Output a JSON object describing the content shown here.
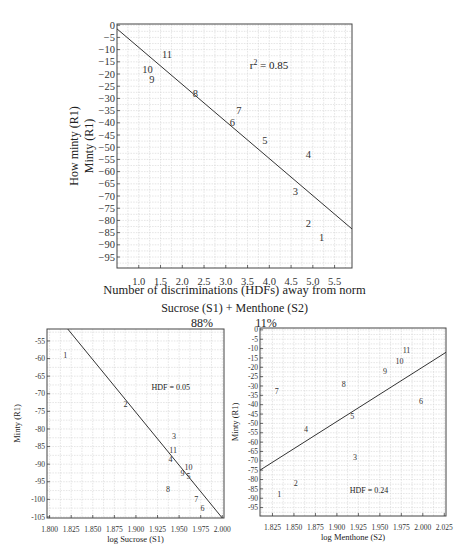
{
  "chart_data": [
    {
      "id": "main",
      "type": "scatter",
      "title": "",
      "xlabel": "Number of discriminations (HDFs) away from norm",
      "ylabel_lines": [
        "How minty (R1)",
        "Minty (R1)"
      ],
      "annotation": "r² = 0.85",
      "annotation_pos": [
        3.55,
        -18
      ],
      "xlim": [
        0.5,
        5.9
      ],
      "ylim": [
        -99.5,
        0.5
      ],
      "xticks": [
        1.0,
        1.5,
        2.0,
        2.5,
        3.0,
        3.5,
        4.0,
        4.5,
        5.0,
        5.5
      ],
      "xtick_labels": [
        "1.0",
        "1.5",
        "2.0",
        "2.5",
        "3.0",
        "3.5",
        "4.0",
        "4.5",
        "5.0",
        "5.5"
      ],
      "yticks": [
        0,
        -5,
        -10,
        -15,
        -20,
        -25,
        -30,
        -35,
        -40,
        -45,
        -50,
        -55,
        -60,
        -65,
        -70,
        -75,
        -80,
        -85,
        -90,
        -95
      ],
      "ytick_labels": [
        "0",
        "−5",
        "−10",
        "−15",
        "−20",
        "−25",
        "−30",
        "−35",
        "−40",
        "−45",
        "−50",
        "−55",
        "−60",
        "−65",
        "−70",
        "−75",
        "−80",
        "−85",
        "−90",
        "−95"
      ],
      "grid": true,
      "points": [
        {
          "label": "1",
          "x": 5.2,
          "y": -87
        },
        {
          "label": "2",
          "x": 4.9,
          "y": -81
        },
        {
          "label": "3",
          "x": 4.6,
          "y": -68
        },
        {
          "label": "4",
          "x": 4.9,
          "y": -53
        },
        {
          "label": "5",
          "x": 3.9,
          "y": -47
        },
        {
          "label": "6",
          "x": 3.15,
          "y": -40
        },
        {
          "label": "7",
          "x": 3.3,
          "y": -35
        },
        {
          "label": "8",
          "x": 2.3,
          "y": -28
        },
        {
          "label": "9",
          "x": 1.3,
          "y": -22
        },
        {
          "label": "10",
          "x": 1.2,
          "y": -18
        },
        {
          "label": "11",
          "x": 1.65,
          "y": -12
        }
      ],
      "fit_line": {
        "x": [
          0.5,
          5.9
        ],
        "y": [
          -1.5,
          -83.5
        ]
      },
      "r_squared": 0.85
    },
    {
      "id": "sucrose",
      "type": "scatter",
      "title": "",
      "xlabel": "log Sucrose (S1)",
      "ylabel": "Minty (R1)",
      "annotation": "HDF = 0.05",
      "annotation_pos": [
        1.918,
        -69
      ],
      "xlim": [
        1.797,
        2.002
      ],
      "ylim": [
        -105.3,
        -51.6
      ],
      "xticks": [
        1.8,
        1.825,
        1.85,
        1.875,
        1.9,
        1.925,
        1.95,
        1.975,
        2.0
      ],
      "xtick_labels": [
        "1.800",
        "1.825",
        "1.850",
        "1.875",
        "1.900",
        "1.925",
        "1.950",
        "1.975",
        "2.000"
      ],
      "yticks": [
        -55,
        -60,
        -65,
        -70,
        -75,
        -80,
        -85,
        -90,
        -95,
        -100,
        -105
      ],
      "ytick_labels": [
        "-55",
        "-60",
        "-65",
        "-70",
        "-75",
        "-80",
        "-85",
        "-90",
        "-95",
        "-100",
        "-105"
      ],
      "grid": true,
      "points": [
        {
          "label": "1",
          "x": 1.818,
          "y": -59
        },
        {
          "label": "2",
          "x": 1.888,
          "y": -73
        },
        {
          "label": "3",
          "x": 1.944,
          "y": -82
        },
        {
          "label": "4",
          "x": 1.94,
          "y": -88.5
        },
        {
          "label": "5",
          "x": 1.961,
          "y": -93.5
        },
        {
          "label": "6",
          "x": 1.977,
          "y": -102.5
        },
        {
          "label": "7",
          "x": 1.97,
          "y": -100
        },
        {
          "label": "8",
          "x": 1.937,
          "y": -97
        },
        {
          "label": "9",
          "x": 1.954,
          "y": -92.5
        },
        {
          "label": "10",
          "x": 1.961,
          "y": -91
        },
        {
          "label": "11",
          "x": 1.943,
          "y": -86
        }
      ],
      "fit_line": {
        "x": [
          1.821,
          2.0
        ],
        "y": [
          -51.6,
          -105.3
        ]
      },
      "hdf": 0.05
    },
    {
      "id": "menthone",
      "type": "scatter",
      "title": "",
      "xlabel": "log Menthone (S2)",
      "ylabel": "Minty (R1)",
      "annotation": "HDF = 0.24",
      "annotation_pos": [
        1.915,
        -87
      ],
      "xlim": [
        1.8105,
        2.027
      ],
      "ylim": [
        -99.5,
        1
      ],
      "xticks": [
        1.825,
        1.85,
        1.875,
        1.9,
        1.925,
        1.95,
        1.975,
        2.0,
        2.025
      ],
      "xtick_labels": [
        "1.825",
        "1.850",
        "1.875",
        "1.900",
        "1.925",
        "1.950",
        "1.975",
        "2.000",
        "2.025"
      ],
      "yticks": [
        0,
        -5,
        -10,
        -15,
        -20,
        -25,
        -30,
        -35,
        -40,
        -45,
        -50,
        -55,
        -60,
        -65,
        -70,
        -75,
        -80,
        -85,
        -90,
        -95
      ],
      "ytick_labels": [
        "0",
        "-5",
        "-10",
        "-15",
        "-20",
        "-25",
        "-30",
        "-35",
        "-40",
        "-45",
        "-50",
        "-55",
        "-60",
        "-65",
        "-70",
        "-75",
        "-80",
        "-85",
        "-90",
        "-95"
      ],
      "grid": true,
      "points": [
        {
          "label": "1",
          "x": 1.833,
          "y": -88
        },
        {
          "label": "2",
          "x": 1.852,
          "y": -82
        },
        {
          "label": "3",
          "x": 1.921,
          "y": -68
        },
        {
          "label": "4",
          "x": 1.864,
          "y": -53
        },
        {
          "label": "5",
          "x": 1.918,
          "y": -46
        },
        {
          "label": "6",
          "x": 1.998,
          "y": -38
        },
        {
          "label": "7",
          "x": 1.83,
          "y": -33
        },
        {
          "label": "8",
          "x": 1.908,
          "y": -29
        },
        {
          "label": "9",
          "x": 1.956,
          "y": -22
        },
        {
          "label": "10",
          "x": 1.973,
          "y": -17
        },
        {
          "label": "11",
          "x": 1.981,
          "y": -11
        }
      ],
      "fit_line": {
        "x": [
          1.8105,
          2.027
        ],
        "y": [
          -75,
          -12
        ]
      },
      "hdf": 0.24
    }
  ],
  "captions": {
    "mixture": "Sucrose (S1) + Menthone (S2)",
    "pct_sucrose": "88%",
    "pct_menthone": "11%"
  }
}
